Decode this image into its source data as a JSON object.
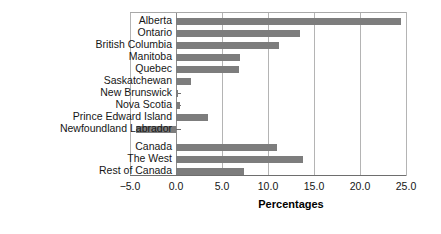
{
  "chart_data": {
    "type": "bar",
    "orientation": "horizontal",
    "title": "",
    "xlabel": "Percentages",
    "ylabel": "",
    "xlim": [
      -5.0,
      25.0
    ],
    "xticks": [
      -5.0,
      0.0,
      5.0,
      10.0,
      15.0,
      20.0,
      25.0
    ],
    "xtick_labels": [
      "−5.0",
      "0.0",
      "5.0",
      "10.0",
      "15.0",
      "20.0",
      "25.0"
    ],
    "grid": "vertical",
    "legend": "none",
    "bar_color": "#7d7d7d",
    "categories": [
      "Alberta",
      "Ontario",
      "British Columbia",
      "Manitoba",
      "Quebec",
      "Saskatchewan",
      "New Brunswick",
      "Nova Scotia",
      "Prince Edward Island",
      "Newfoundland Labrador",
      "Canada",
      "The West",
      "Rest of Canada"
    ],
    "values": [
      24.5,
      13.5,
      11.2,
      7.0,
      6.9,
      1.6,
      0.2,
      0.4,
      3.5,
      -4.4,
      11.0,
      13.8,
      7.4
    ],
    "group_break_after": "Newfoundland Labrador"
  }
}
